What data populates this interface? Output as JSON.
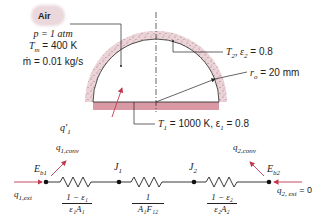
{
  "fluid": {
    "label": "Air",
    "pressure": "p = 1 atm",
    "mean_temp": "T",
    "mean_temp_sub": "m",
    "mean_temp_value": " = 400 K",
    "mass_flow": "ṁ = 0.01 kg/s"
  },
  "geometry": {
    "outer_surface_label": "T",
    "outer_surface_sub": "2",
    "outer_surface_rest": ", ε",
    "outer_surface_eps_sub": "2",
    "outer_surface_value": " = 0.8",
    "radius_label": "r",
    "radius_sub": "o",
    "radius_value": " = 20 mm",
    "base_label": "T",
    "base_sub": "1",
    "base_value": " = 1000 K, ε",
    "base_eps_sub": "1",
    "base_eps_value": " = 0.8",
    "heat_input_label": "q",
    "heat_input_prime": "′",
    "heat_input_sub": "1"
  },
  "network": {
    "node_left": {
      "label": "E",
      "sub": "b1"
    },
    "node_j1": {
      "label": "J",
      "sub": "1"
    },
    "node_j2": {
      "label": "J",
      "sub": "2"
    },
    "node_right": {
      "label": "E",
      "sub": "b2"
    },
    "q1_conv": {
      "label": "q",
      "sub": "1,conv"
    },
    "q2_conv": {
      "label": "q",
      "sub": "2,conv"
    },
    "q1_ext": {
      "label": "q",
      "sub": "1,ext"
    },
    "q2_ext": {
      "label": "q",
      "sub": "2, ext",
      "value": " = 0"
    },
    "resistor1": {
      "num": "1 − ε₁",
      "den": "ε₁A₁"
    },
    "resistor2": {
      "num": "1",
      "den": "A₁F₁₂"
    },
    "resistor3": {
      "num": "1 − ε₂",
      "den": "ε₂A₂"
    }
  },
  "colors": {
    "insulation": "#e6cbd1",
    "base_plate": "#d99aa5",
    "arrow": "#c0394f",
    "line": "#222222"
  }
}
